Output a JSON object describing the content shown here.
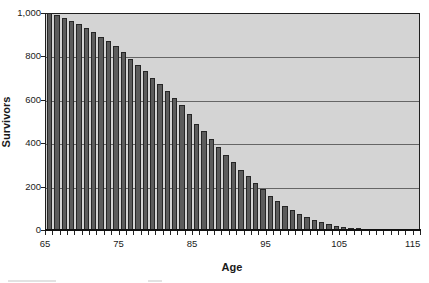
{
  "chart_data": {
    "type": "bar",
    "title": "",
    "xlabel": "Age",
    "ylabel": "Survivors",
    "categories": [
      65,
      66,
      67,
      68,
      69,
      70,
      71,
      72,
      73,
      74,
      75,
      76,
      77,
      78,
      79,
      80,
      81,
      82,
      83,
      84,
      85,
      86,
      87,
      88,
      89,
      90,
      91,
      92,
      93,
      94,
      95,
      96,
      97,
      98,
      99,
      100,
      101,
      102,
      103,
      104,
      105,
      106,
      107,
      108,
      109
    ],
    "values": [
      1000,
      990,
      977,
      963,
      948,
      930,
      911,
      890,
      869,
      847,
      822,
      790,
      762,
      732,
      702,
      671,
      640,
      608,
      577,
      533,
      490,
      454,
      420,
      382,
      346,
      312,
      278,
      247,
      215,
      187,
      158,
      132,
      110,
      90,
      73,
      58,
      46,
      36,
      27,
      20,
      15,
      10,
      7,
      4,
      2
    ],
    "ylim": [
      0,
      1000
    ],
    "y_tick_interval": 200,
    "y_tick_labels": [
      "1,000",
      "800",
      "600",
      "400",
      "200",
      "0"
    ],
    "y_tick_values": [
      1000,
      800,
      600,
      400,
      200,
      0
    ],
    "x_axis_start": 65,
    "x_axis_end": 116,
    "x_labeled_ticks": [
      65,
      75,
      85,
      95,
      105,
      115
    ],
    "x_minor_tick_every": 1,
    "grid": "horizontal",
    "legend": "none",
    "colors": {
      "plot_background": "#d4d4d4",
      "bar_fill": "#5c5c5c",
      "bar_border": "#262626",
      "gridline": "#666666",
      "frame": "#1f1f1f",
      "text": "#1a1a1a",
      "page_background": "#ffffff"
    }
  }
}
